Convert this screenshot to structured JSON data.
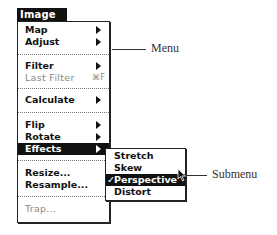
{
  "menu": {
    "title": "Image",
    "items": [
      {
        "label": "Map",
        "submenu": true,
        "enabled": true
      },
      {
        "label": "Adjust",
        "submenu": true,
        "enabled": true
      },
      {
        "label": "Filter",
        "submenu": true,
        "enabled": true
      },
      {
        "label": "Last Filter",
        "shortcut": "⌘F",
        "enabled": false
      },
      {
        "label": "Calculate",
        "submenu": true,
        "enabled": true
      },
      {
        "label": "Flip",
        "submenu": true,
        "enabled": true
      },
      {
        "label": "Rotate",
        "submenu": true,
        "enabled": true
      },
      {
        "label": "Effects",
        "submenu": true,
        "enabled": true,
        "selected": true
      },
      {
        "label": "Resize...",
        "enabled": true
      },
      {
        "label": "Resample...",
        "enabled": true
      },
      {
        "label": "Trap...",
        "enabled": false
      }
    ]
  },
  "submenu": {
    "items": [
      {
        "label": "Stretch",
        "checked": false
      },
      {
        "label": "Skew",
        "checked": false
      },
      {
        "label": "Perspective",
        "checked": true,
        "selected": true
      },
      {
        "label": "Distort",
        "checked": false
      }
    ],
    "check_glyph": "✓"
  },
  "callouts": {
    "menu_label": "Menu",
    "submenu_label": "Submenu"
  },
  "colors": {
    "highlight": "#111111",
    "disabled_text": "#888888"
  }
}
